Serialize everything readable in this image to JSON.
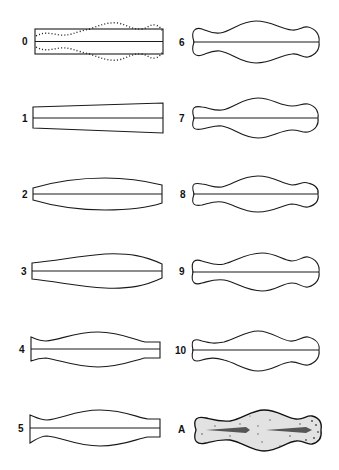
{
  "figure": {
    "colors": {
      "line": "#1a1a1a",
      "background": "#ffffff",
      "specimen_fill": "#e2e2e2"
    },
    "left_column": [
      {
        "label": "0",
        "style": "rectangle with dotted wavy overlay"
      },
      {
        "label": "1",
        "style": "tapered trapezoid"
      },
      {
        "label": "2",
        "style": "symmetric lens"
      },
      {
        "label": "3",
        "style": "asymmetric lens, bulge right of center"
      },
      {
        "label": "4",
        "style": "single central bulge with waist at left"
      },
      {
        "label": "5",
        "style": "single central bulge, deeper left waist"
      }
    ],
    "right_column": [
      {
        "label": "6",
        "style": "double waist, rounded ends"
      },
      {
        "label": "7",
        "style": "double waist, rounded ends"
      },
      {
        "label": "8",
        "style": "double waist, rounded ends"
      },
      {
        "label": "9",
        "style": "double waist, rounded ends"
      },
      {
        "label": "10",
        "style": "double waist, rounded ends"
      },
      {
        "label": "A",
        "style": "stippled specimen outline"
      }
    ]
  }
}
